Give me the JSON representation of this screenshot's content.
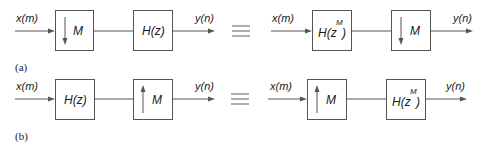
{
  "diagram": {
    "colors": {
      "stroke": "#555555",
      "text": "#1a1a1a",
      "background": "#ffffff"
    },
    "equivalence_symbol": "≡",
    "rows": [
      {
        "caption": "(a)",
        "left": {
          "input": "x(m)",
          "output": "y(n)",
          "blocks": [
            {
              "type": "downsampler",
              "arrow": "down",
              "label": "M"
            },
            {
              "type": "filter",
              "label_main": "H(z)"
            }
          ]
        },
        "right": {
          "input": "x(m)",
          "output": "y(n)",
          "blocks": [
            {
              "type": "filter",
              "label_main": "H(z",
              "label_sup": "M",
              "label_close": ")"
            },
            {
              "type": "downsampler",
              "arrow": "down",
              "label": "M"
            }
          ]
        }
      },
      {
        "caption": "(b)",
        "left": {
          "input": "x(m)",
          "output": "y(n)",
          "blocks": [
            {
              "type": "filter",
              "label_main": "H(z)"
            },
            {
              "type": "upsampler",
              "arrow": "up",
              "label": "M"
            }
          ]
        },
        "right": {
          "input": "x(m)",
          "output": "y(n)",
          "blocks": [
            {
              "type": "upsampler",
              "arrow": "up",
              "label": "M"
            },
            {
              "type": "filter",
              "label_main": "H(z",
              "label_sup": "M",
              "label_close": ")"
            }
          ]
        }
      }
    ]
  }
}
